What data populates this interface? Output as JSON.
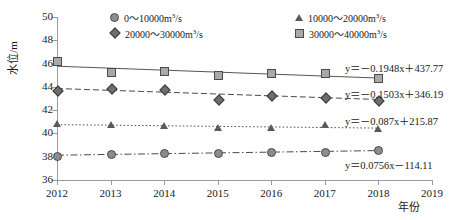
{
  "chart_data": {
    "type": "line",
    "title": "",
    "xlabel": "年份",
    "ylabel": "水位/m",
    "x": [
      2012,
      2013,
      2014,
      2015,
      2016,
      2017,
      2018
    ],
    "xlim": [
      2012,
      2019
    ],
    "ylim": [
      36,
      50
    ],
    "xticks": [
      "2012",
      "2013",
      "2014",
      "2015",
      "2016",
      "2017",
      "2018",
      "2019"
    ],
    "yticks": [
      "36",
      "38",
      "40",
      "42",
      "44",
      "46",
      "48",
      "50"
    ],
    "grid": false,
    "legend_position": "top-inside",
    "series": [
      {
        "name": "0~10000m3/s",
        "marker": "circle",
        "linestyle": "dashdot",
        "color": "#8c8c8c",
        "values": [
          38.1,
          38.2,
          38.3,
          38.35,
          38.4,
          38.4,
          38.55
        ],
        "trendline": "y = 0.0756x - 114.11"
      },
      {
        "name": "10000~20000m3/s",
        "marker": "triangle",
        "linestyle": "dotted",
        "color": "#5a5a5a",
        "values": [
          40.85,
          40.7,
          40.6,
          40.5,
          40.45,
          40.75,
          40.4
        ],
        "trendline": "y = -0.087x + 215.87"
      },
      {
        "name": "20000~30000m3/s",
        "marker": "diamond",
        "linestyle": "dashed",
        "color": "#6e6e6e",
        "values": [
          43.7,
          43.9,
          43.8,
          42.95,
          43.3,
          43.15,
          42.9
        ],
        "trendline": "y = -0.1503x + 346.19"
      },
      {
        "name": "30000~40000m3/s",
        "marker": "square",
        "linestyle": "solid",
        "color": "#a8a8a8",
        "values": [
          46.2,
          45.25,
          45.35,
          45.0,
          45.15,
          45.15,
          44.75
        ],
        "trendline": "y = -0.1948x + 437.77"
      }
    ],
    "annotations": [
      {
        "text": "y = -0.1948x + 437.77",
        "series": "30000~40000m3/s"
      },
      {
        "text": "y = -0.1503x + 346.19",
        "series": "20000~30000m3/s"
      },
      {
        "text": "y = -0.087x + 215.87",
        "series": "10000~20000m3/s"
      },
      {
        "text": "y = 0.0756x - 114.11",
        "series": "0~10000m3/s"
      }
    ]
  },
  "axes": {
    "y_title": "水位/m",
    "x_title": "年份",
    "y_ticks": [
      "50",
      "48",
      "46",
      "44",
      "42",
      "40",
      "38",
      "36"
    ],
    "x_ticks": [
      "2012",
      "2013",
      "2014",
      "2015",
      "2016",
      "2017",
      "2018",
      "2019"
    ]
  },
  "legend": {
    "items": [
      {
        "marker": "circle-icon",
        "range": "0～10000",
        "unit_base": "m",
        "unit_sup": "3",
        "unit_tail": "/s",
        "label": "0～10000m3/s"
      },
      {
        "marker": "triangle-icon",
        "range": "10000～20000",
        "unit_base": "m",
        "unit_sup": "3",
        "unit_tail": "/s",
        "label": "10000～20000m3/s"
      },
      {
        "marker": "diamond-icon",
        "range": "20000～30000",
        "unit_base": "m",
        "unit_sup": "3",
        "unit_tail": "/s",
        "label": "20000～30000m3/s"
      },
      {
        "marker": "square-icon",
        "range": "30000～40000",
        "unit_base": "m",
        "unit_sup": "3",
        "unit_tail": "/s",
        "label": "30000～40000m3/s"
      }
    ]
  },
  "equations": {
    "eq1": {
      "lhs": "y",
      "eq": "＝",
      "rhs": "－0.1948x＋437.77",
      "full": "y＝－0.1948x＋437.77"
    },
    "eq2": {
      "lhs": "y",
      "eq": "＝",
      "rhs": "－0.1503x＋346.19",
      "full": "y＝－0.1503x＋346.19"
    },
    "eq3": {
      "lhs": "y",
      "eq": "＝",
      "rhs": "－0.087x＋215.87",
      "full": "y＝－0.087x＋215.87"
    },
    "eq4": {
      "lhs": "y",
      "eq": "＝",
      "rhs": "0.0756x－114.11",
      "full": "y＝0.0756x－114.11"
    }
  },
  "colors": {
    "axis": "#9a9a9a",
    "text": "#1a1a1a",
    "series_square": "#a8a8a8",
    "series_diamond": "#6e6e6e",
    "series_triangle": "#5a5a5a",
    "series_circle": "#8c8c8c"
  }
}
